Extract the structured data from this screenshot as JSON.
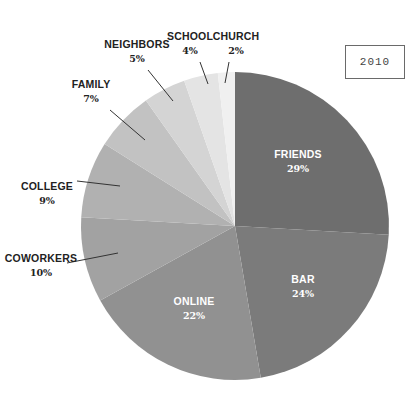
{
  "chart_data": {
    "type": "pie",
    "title": "",
    "year_label": "2010",
    "start_angle_deg": 0,
    "direction": "clockwise",
    "center": [
      235,
      226
    ],
    "radius": 154,
    "slices": [
      {
        "label": "FRIENDS",
        "value": 29,
        "pct_label": "29%",
        "color": "#6e6e6e",
        "label_inside": true
      },
      {
        "label": "BAR",
        "value": 24,
        "pct_label": "24%",
        "color": "#7b7b7b",
        "label_inside": true
      },
      {
        "label": "ONLINE",
        "value": 22,
        "pct_label": "22%",
        "color": "#919191",
        "label_inside": true
      },
      {
        "label": "COWORKERS",
        "value": 10,
        "pct_label": "10%",
        "color": "#a2a2a2",
        "label_inside": false
      },
      {
        "label": "COLLEGE",
        "value": 9,
        "pct_label": "9%",
        "color": "#b1b1b1",
        "label_inside": false
      },
      {
        "label": "FAMILY",
        "value": 7,
        "pct_label": "7%",
        "color": "#c2c2c2",
        "label_inside": false
      },
      {
        "label": "NEIGHBORS",
        "value": 5,
        "pct_label": "5%",
        "color": "#d4d4d4",
        "label_inside": false
      },
      {
        "label": "SCHOOL",
        "value": 4,
        "pct_label": "4%",
        "color": "#e4e4e4",
        "label_inside": false
      },
      {
        "label": "CHURCH",
        "value": 2,
        "pct_label": "2%",
        "color": "#f0f0f0",
        "label_inside": false
      }
    ],
    "label_positions": [
      {
        "x": 298,
        "y": 158,
        "color": "#ffffff"
      },
      {
        "x": 303,
        "y": 283,
        "color": "#ffffff"
      },
      {
        "x": 194,
        "y": 305,
        "color": "#ffffff"
      },
      {
        "x": 41,
        "y": 262,
        "color": "#222222",
        "leader": [
          [
            67,
            263
          ],
          [
            118,
            253
          ]
        ]
      },
      {
        "x": 47,
        "y": 190,
        "color": "#222222",
        "leader": [
          [
            77,
            181
          ],
          [
            120,
            186
          ]
        ]
      },
      {
        "x": 91,
        "y": 88,
        "color": "#222222",
        "leader": [
          [
            110,
            110
          ],
          [
            145,
            140
          ]
        ]
      },
      {
        "x": 137,
        "y": 48,
        "color": "#222222",
        "leader": [
          [
            148,
            70
          ],
          [
            173,
            101
          ]
        ]
      },
      {
        "x": 190,
        "y": 40,
        "color": "#222222",
        "leader": [
          [
            200,
            62
          ],
          [
            208,
            84
          ]
        ]
      },
      {
        "x": 236,
        "y": 40,
        "color": "#222222",
        "leader": [
          [
            229,
            62
          ],
          [
            225,
            83
          ]
        ]
      }
    ]
  }
}
